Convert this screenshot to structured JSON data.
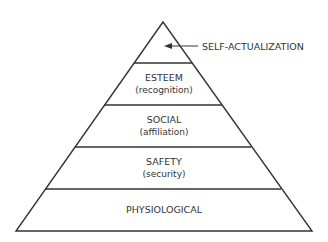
{
  "diagram": {
    "type": "pyramid",
    "levels": [
      {
        "name": "SELF-ACTUALIZATION",
        "detail": ""
      },
      {
        "name": "ESTEEM",
        "detail": "(recognition)"
      },
      {
        "name": "SOCIAL",
        "detail": "(affiliation)"
      },
      {
        "name": "SAFETY",
        "detail": "(security)"
      },
      {
        "name": "PHYSIOLOGICAL",
        "detail": ""
      }
    ],
    "line_color": "#333333"
  }
}
